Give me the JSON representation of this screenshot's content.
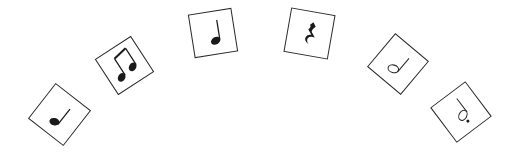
{
  "figure": {
    "ink_color": "#1a1a1a",
    "border_color": "#2a2a2a",
    "background_color": "#ffffff"
  },
  "cards": [
    {
      "symbol": "quarter-note",
      "label": "Quarter note",
      "cx": 59,
      "cy": 114,
      "size": 45,
      "rotation": 38
    },
    {
      "symbol": "beamed-eighth-notes",
      "label": "Pair of eighth notes",
      "cx": 124,
      "cy": 65,
      "size": 43,
      "rotation": -33
    },
    {
      "symbol": "quarter-note",
      "label": "Quarter note",
      "cx": 213,
      "cy": 33,
      "size": 44,
      "rotation": -9
    },
    {
      "symbol": "quarter-rest",
      "label": "Quarter rest",
      "cx": 309,
      "cy": 33,
      "size": 45,
      "rotation": 10
    },
    {
      "symbol": "half-note",
      "label": "Half note",
      "cx": 398,
      "cy": 64,
      "size": 44,
      "rotation": 40
    },
    {
      "symbol": "dotted-half-note",
      "label": "Dotted half note",
      "cx": 461,
      "cy": 112,
      "size": 44,
      "rotation": -37
    }
  ]
}
